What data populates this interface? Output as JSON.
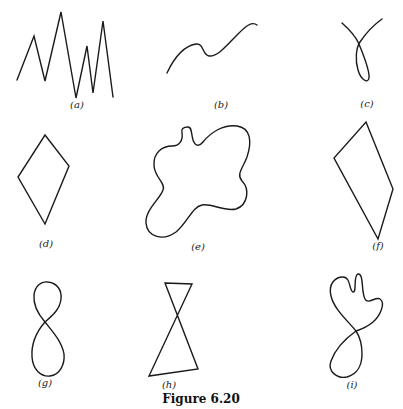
{
  "figure": {
    "caption": "Figure 6.20",
    "stroke_color": "#1a1a1a",
    "panels": [
      {
        "id": "a",
        "label": "(a)",
        "kind": "open zigzag polyline",
        "label_pos": [
          77,
          105
        ]
      },
      {
        "id": "b",
        "label": "(b)",
        "kind": "open smooth curve",
        "label_pos": [
          221,
          105
        ]
      },
      {
        "id": "c",
        "label": "(c)",
        "kind": "open curve with single loop",
        "label_pos": [
          367,
          104
        ]
      },
      {
        "id": "d",
        "label": "(d)",
        "kind": "closed quadrilateral (kite)",
        "label_pos": [
          46,
          244
        ]
      },
      {
        "id": "e",
        "label": "(e)",
        "kind": "closed smooth blob",
        "label_pos": [
          198,
          247
        ]
      },
      {
        "id": "f",
        "label": "(f)",
        "kind": "closed quadrilateral",
        "label_pos": [
          378,
          246
        ]
      },
      {
        "id": "g",
        "label": "(g)",
        "kind": "figure-eight (self-intersecting closed curve)",
        "label_pos": [
          45,
          383
        ]
      },
      {
        "id": "h",
        "label": "(h)",
        "kind": "bowtie (self-intersecting closed polygon)",
        "label_pos": [
          169,
          385
        ]
      },
      {
        "id": "i",
        "label": "(i)",
        "kind": "self-intersecting closed curve",
        "label_pos": [
          352,
          385
        ]
      }
    ]
  }
}
